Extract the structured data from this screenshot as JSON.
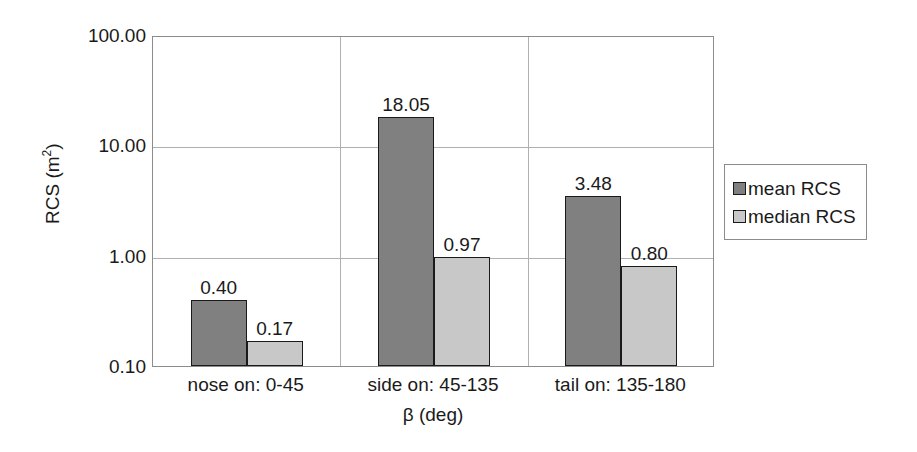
{
  "chart_data": {
    "type": "bar",
    "title": "",
    "xlabel": "β (deg)",
    "ylabel": "RCS (m²)",
    "ylabel_base": "RCS (m",
    "ylabel_exp": "2",
    "ylabel_close": ")",
    "yscale": "log",
    "ylim": [
      0.1,
      100.0
    ],
    "ytick_values": [
      100.0,
      10.0,
      1.0,
      0.1
    ],
    "ytick_labels": [
      "100.00",
      "10.00",
      "1.00",
      "0.10"
    ],
    "grid": true,
    "legend_position": "right",
    "categories": [
      "nose on:  0-45",
      "side on: 45-135",
      "tail on: 135-180"
    ],
    "series": [
      {
        "name": "mean RCS",
        "color": "#808080",
        "values": [
          0.4,
          18.05,
          3.48
        ],
        "labels": [
          "0.40",
          "18.05",
          "3.48"
        ]
      },
      {
        "name": "median RCS",
        "color": "#c8c8c8",
        "values": [
          0.17,
          0.97,
          0.8
        ],
        "labels": [
          "0.17",
          "0.97",
          "0.80"
        ]
      }
    ]
  },
  "legend": {
    "items": [
      {
        "label": "mean RCS",
        "color": "#808080"
      },
      {
        "label": "median RCS",
        "color": "#c8c8c8"
      }
    ]
  },
  "axes": {
    "y_title": "RCS (m2)",
    "x_title": "β (deg)"
  },
  "colors": {
    "mean": "#808080",
    "median": "#c8c8c8",
    "bar_border": "#1a1a1a",
    "grid": "#b0b0b0",
    "frame": "#8c8c8c",
    "background": "#ffffff",
    "text": "#1a1a1a"
  }
}
